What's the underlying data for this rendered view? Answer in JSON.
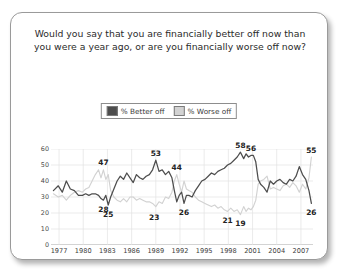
{
  "card": {
    "title": "Would you say that you are financially better off now than you were a year ago, or are you financially worse off now?"
  },
  "legend": {
    "position": "top-center",
    "items": [
      {
        "label": "% Better off",
        "color": "#4d4d4d"
      },
      {
        "label": "% Worse off",
        "color": "#d2d2d2"
      }
    ]
  },
  "chart_data": {
    "type": "line",
    "title": "Would you say that you are financially better off now than you were a year ago, or are you financially worse off now?",
    "xlabel": "",
    "ylabel": "",
    "ylim": [
      0,
      60
    ],
    "yticks": [
      0,
      10,
      20,
      30,
      40,
      50,
      60
    ],
    "xlim": [
      1976,
      2008.5
    ],
    "xticks": [
      1977,
      1980,
      1983,
      1986,
      1989,
      1992,
      1995,
      1998,
      2001,
      2004,
      2007
    ],
    "grid": true,
    "legend_position": "top-center",
    "series": [
      {
        "name": "% Better off",
        "color": "#4d4d4d",
        "x": [
          1976.3,
          1976.9,
          1977.4,
          1977.9,
          1978.4,
          1978.9,
          1979.4,
          1979.9,
          1980.3,
          1980.7,
          1981.1,
          1981.5,
          1981.9,
          1982.2,
          1982.5,
          1982.8,
          1983.1,
          1983.4,
          1983.8,
          1984.2,
          1984.6,
          1985.0,
          1985.4,
          1985.8,
          1986.2,
          1986.6,
          1987.0,
          1987.4,
          1987.8,
          1988.2,
          1988.6,
          1989.0,
          1989.4,
          1989.8,
          1990.2,
          1990.6,
          1991.0,
          1991.3,
          1991.6,
          1991.9,
          1992.2,
          1992.5,
          1992.8,
          1993.1,
          1993.5,
          1993.9,
          1994.3,
          1994.7,
          1995.1,
          1995.5,
          1995.9,
          1996.3,
          1996.7,
          1997.1,
          1997.5,
          1997.9,
          1998.3,
          1998.7,
          1999.1,
          1999.5,
          1999.9,
          2000.2,
          2000.5,
          2000.8,
          2001.1,
          2001.4,
          2001.7,
          2002.0,
          2002.4,
          2002.8,
          2003.2,
          2003.6,
          2004.0,
          2004.4,
          2004.8,
          2005.2,
          2005.6,
          2006.0,
          2006.4,
          2006.8,
          2007.2,
          2007.6,
          2008.0,
          2008.3
        ],
        "y": [
          34,
          37,
          33,
          40,
          35,
          34,
          31,
          31,
          32,
          31,
          32,
          32,
          31,
          29,
          28,
          31,
          25,
          30,
          35,
          40,
          43,
          41,
          45,
          42,
          39,
          44,
          42,
          41,
          43,
          44,
          47,
          53,
          46,
          47,
          44,
          46,
          42,
          34,
          27,
          31,
          33,
          26,
          31,
          31,
          30,
          34,
          37,
          40,
          41,
          43,
          45,
          44,
          46,
          47,
          48,
          50,
          51,
          53,
          55,
          58,
          54,
          57,
          55,
          56,
          56,
          52,
          41,
          38,
          36,
          33,
          40,
          38,
          40,
          41,
          39,
          38,
          41,
          40,
          43,
          49,
          44,
          41,
          34,
          26
        ]
      },
      {
        "name": "% Worse off",
        "color": "#d2d2d2",
        "x": [
          1976.3,
          1976.9,
          1977.4,
          1977.9,
          1978.4,
          1978.9,
          1979.4,
          1979.9,
          1980.3,
          1980.7,
          1981.1,
          1981.5,
          1981.9,
          1982.2,
          1982.5,
          1982.8,
          1983.1,
          1983.4,
          1983.8,
          1984.2,
          1984.6,
          1985.0,
          1985.4,
          1985.8,
          1986.2,
          1986.6,
          1987.0,
          1987.4,
          1987.8,
          1988.2,
          1988.6,
          1989.0,
          1989.4,
          1989.8,
          1990.2,
          1990.6,
          1991.0,
          1991.3,
          1991.6,
          1991.9,
          1992.2,
          1992.5,
          1992.8,
          1993.1,
          1993.5,
          1993.9,
          1994.3,
          1994.7,
          1995.1,
          1995.5,
          1995.9,
          1996.3,
          1996.7,
          1997.1,
          1997.5,
          1997.9,
          1998.3,
          1998.7,
          1999.1,
          1999.5,
          1999.9,
          2000.2,
          2000.5,
          2000.8,
          2001.1,
          2001.4,
          2001.7,
          2002.0,
          2002.4,
          2002.8,
          2003.2,
          2003.6,
          2004.0,
          2004.4,
          2004.8,
          2005.2,
          2005.6,
          2006.0,
          2006.4,
          2006.8,
          2007.2,
          2007.6,
          2008.0,
          2008.3
        ],
        "y": [
          32,
          30,
          31,
          28,
          31,
          33,
          34,
          33,
          35,
          36,
          40,
          44,
          47,
          42,
          47,
          41,
          44,
          34,
          30,
          28,
          27,
          29,
          27,
          30,
          30,
          28,
          29,
          28,
          27,
          27,
          26,
          24,
          27,
          26,
          30,
          29,
          33,
          40,
          44,
          38,
          33,
          40,
          35,
          34,
          33,
          30,
          28,
          27,
          26,
          25,
          24,
          25,
          23,
          24,
          22,
          21,
          23,
          21,
          22,
          19,
          24,
          21,
          23,
          22,
          24,
          28,
          38,
          40,
          41,
          43,
          35,
          36,
          35,
          34,
          37,
          38,
          36,
          39,
          37,
          33,
          38,
          35,
          42,
          55
        ]
      }
    ],
    "annotations": [
      {
        "text": "47",
        "x": 1982.5,
        "y": 47,
        "series": "% Worse off",
        "place": "above"
      },
      {
        "text": "28",
        "x": 1982.5,
        "y": 28,
        "series": "% Better off",
        "place": "below"
      },
      {
        "text": "25",
        "x": 1983.1,
        "y": 25,
        "series": "% Better off",
        "place": "below"
      },
      {
        "text": "53",
        "x": 1989.0,
        "y": 53,
        "series": "% Better off",
        "place": "above"
      },
      {
        "text": "23",
        "x": 1988.8,
        "y": 23,
        "series": "% Worse off",
        "place": "below"
      },
      {
        "text": "44",
        "x": 1991.6,
        "y": 44,
        "series": "% Worse off",
        "place": "above"
      },
      {
        "text": "26",
        "x": 1992.5,
        "y": 26,
        "series": "% Better off",
        "place": "below"
      },
      {
        "text": "58",
        "x": 1999.5,
        "y": 58,
        "series": "% Better off",
        "place": "above"
      },
      {
        "text": "56",
        "x": 2000.8,
        "y": 56,
        "series": "% Better off",
        "place": "above"
      },
      {
        "text": "21",
        "x": 1997.9,
        "y": 21,
        "series": "% Worse off",
        "place": "below"
      },
      {
        "text": "19",
        "x": 1999.5,
        "y": 19,
        "series": "% Worse off",
        "place": "below"
      },
      {
        "text": "55",
        "x": 2008.3,
        "y": 55,
        "series": "% Worse off",
        "place": "above"
      },
      {
        "text": "26",
        "x": 2008.3,
        "y": 26,
        "series": "% Better off",
        "place": "below"
      }
    ]
  }
}
